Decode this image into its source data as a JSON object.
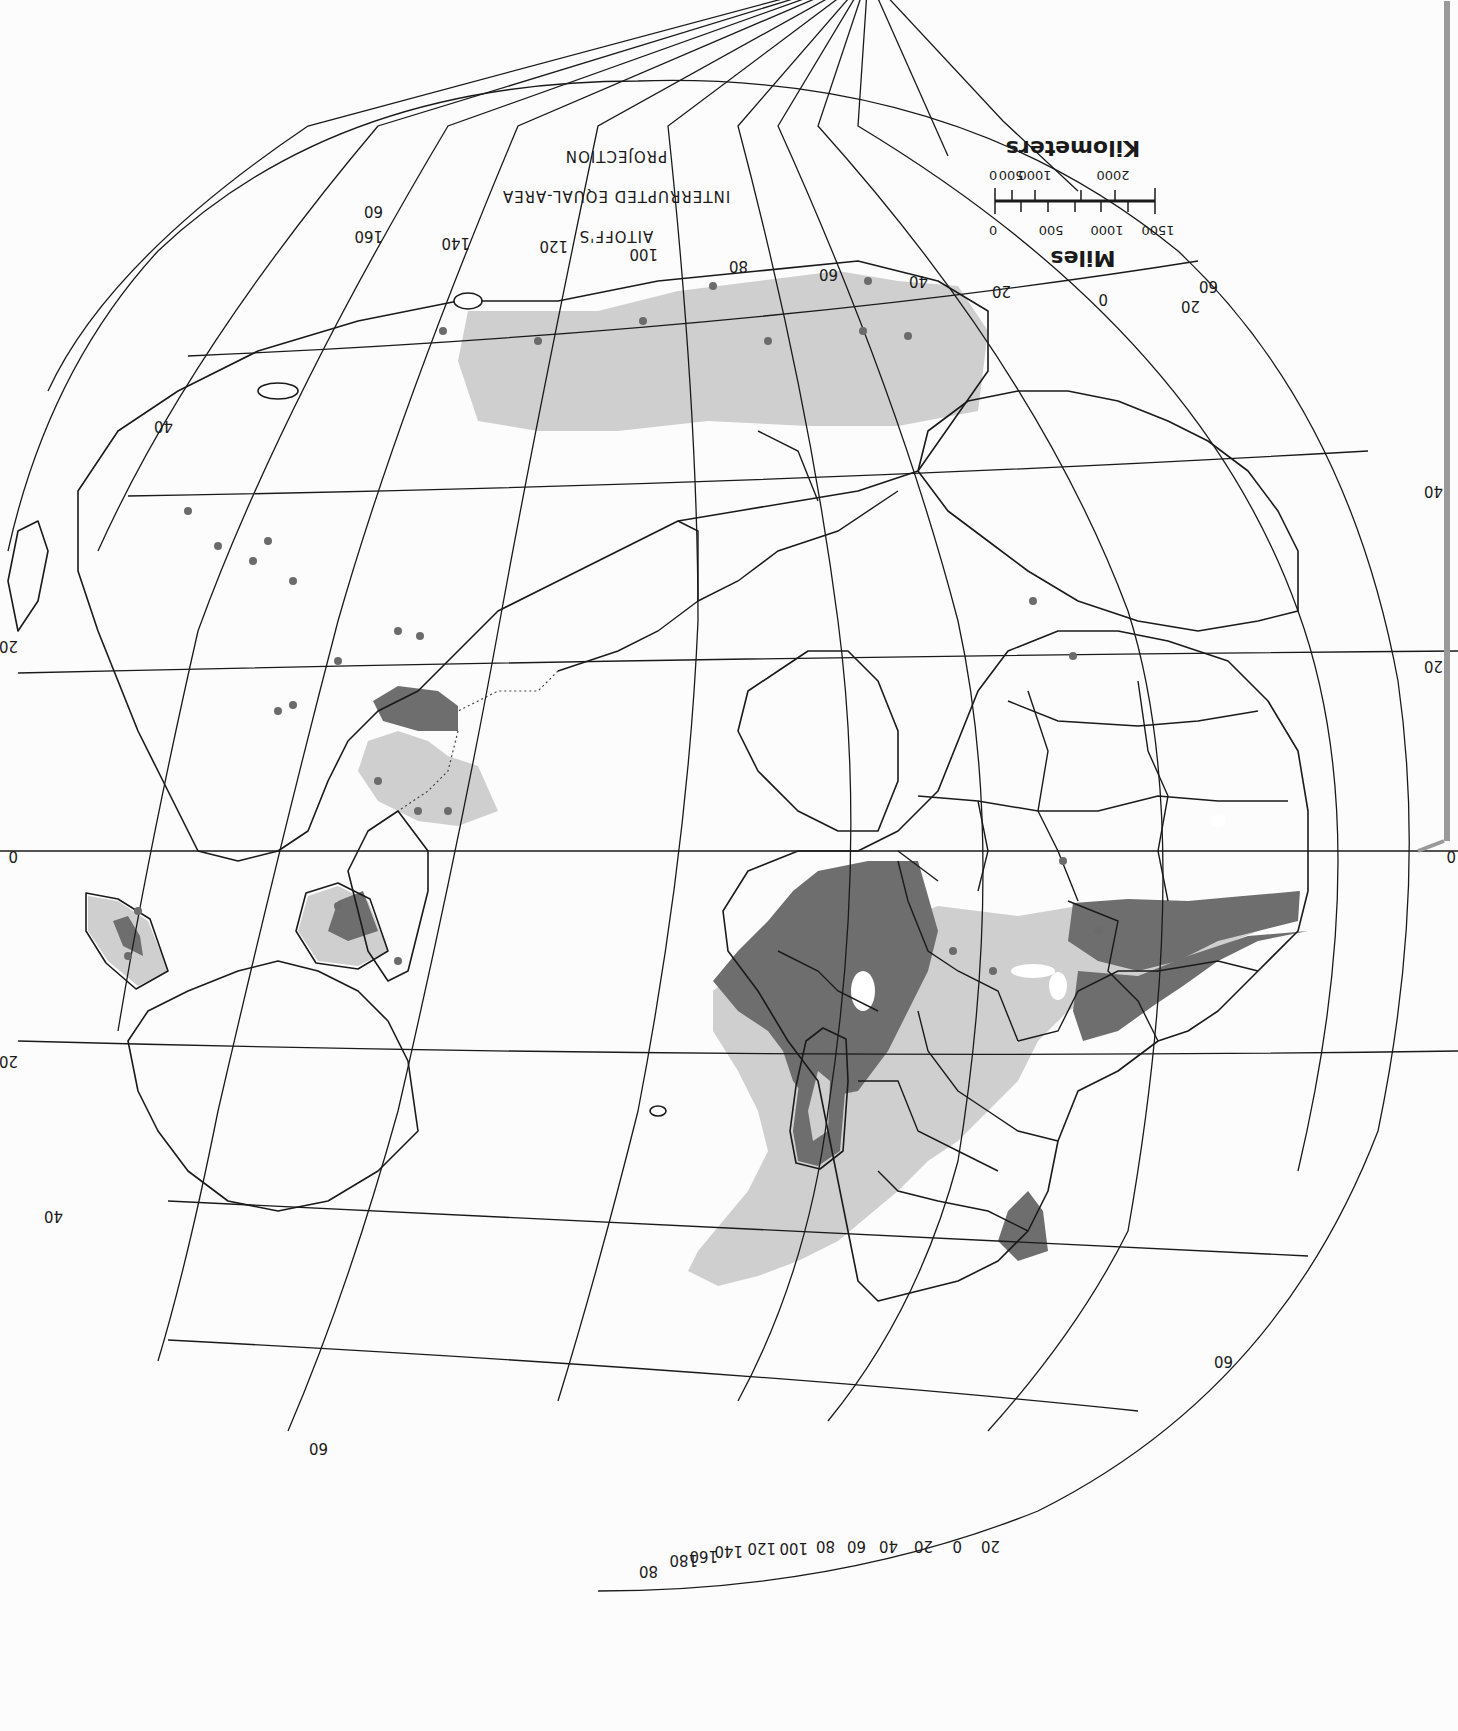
{
  "page": {
    "orientation": "rotated-180",
    "background": "#fcfcfc"
  },
  "title": {
    "line1": "AITOFF'S",
    "line2": "INTERRUPTED EQUAL-AREA",
    "line3": "PROJECTION"
  },
  "scale_bar": {
    "miles_label": "Miles",
    "miles_ticks": [
      "0",
      "500",
      "1000",
      "1500"
    ],
    "km_label": "Kilometers",
    "km_ticks": [
      "0",
      "500",
      "1000",
      "2000"
    ]
  },
  "graticule": {
    "top_meridian_labels": [
      "20",
      "0",
      "20",
      "40",
      "60",
      "80",
      "100",
      "120",
      "140",
      "160"
    ],
    "top_parallel_labels": [
      "60",
      "60"
    ],
    "pole_meridian_labels": [
      "20",
      "0",
      "20",
      "40",
      "60",
      "80",
      "100",
      "120",
      "140",
      "160",
      "180",
      "80"
    ],
    "left_parallel_labels": [
      "40",
      "20",
      "0",
      "20",
      "40",
      "60"
    ],
    "right_parallel_labels": [
      "40",
      "20",
      "0",
      "60"
    ]
  },
  "legend_colors": {
    "high_intensity": "#6e6e6e",
    "moderate_intensity": "#cfcfcf",
    "point_locations": "#6b6b6b",
    "land": "#ffffff",
    "outline": "#1a1a1a"
  }
}
